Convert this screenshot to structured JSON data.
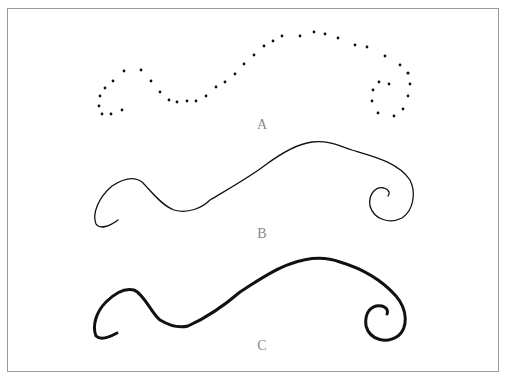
{
  "figure": {
    "labels": {
      "a": "A",
      "b": "B",
      "c": "C"
    },
    "stroke_color": "#111111",
    "label_color": "#8a8a8a",
    "border_color": "#9a9a9a"
  },
  "panels": [
    {
      "label": "A",
      "style": "dotted",
      "description": "curve rendered as discrete dots"
    },
    {
      "label": "B",
      "style": "thin-line",
      "description": "curve rendered as thin continuous stroke"
    },
    {
      "label": "C",
      "style": "thick-line",
      "description": "curve rendered as thick continuous stroke"
    }
  ]
}
